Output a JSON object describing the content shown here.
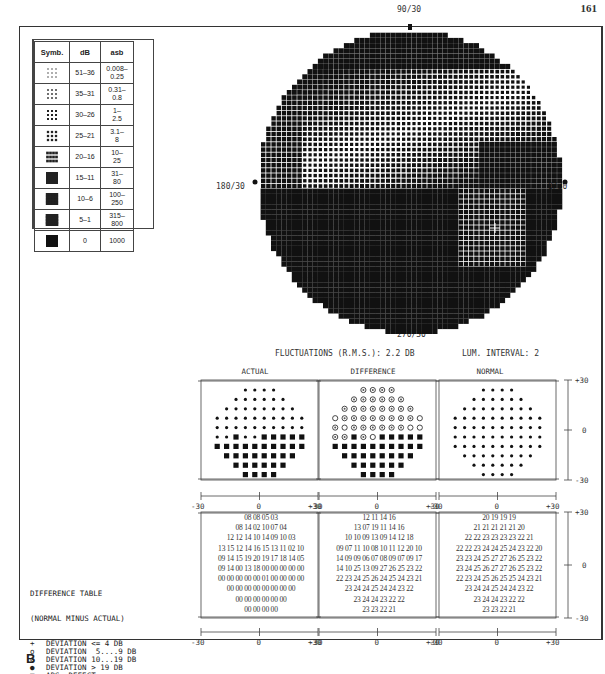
{
  "page_number": "161",
  "figure_label": "B",
  "legend": {
    "headers": [
      "Symb.",
      "dB",
      "asb"
    ],
    "rows": [
      {
        "symbol": "density-1",
        "db": "51–36",
        "asb": "0.008– 0.25"
      },
      {
        "symbol": "density-2",
        "db": "35–31",
        "asb": "0.31– 0.8"
      },
      {
        "symbol": "density-3",
        "db": "30–26",
        "asb": "1– 2.5"
      },
      {
        "symbol": "density-4",
        "db": "25–21",
        "asb": "3.1– 8"
      },
      {
        "symbol": "density-5",
        "db": "20–16",
        "asb": "10– 25"
      },
      {
        "symbol": "density-6",
        "db": "15–11",
        "asb": "31– 80"
      },
      {
        "symbol": "density-7",
        "db": "10–6",
        "asb": "100– 250"
      },
      {
        "symbol": "density-8",
        "db": "5–1",
        "asb": "315– 800"
      },
      {
        "symbol": "solid",
        "db": "0",
        "asb": "1000"
      }
    ]
  },
  "greyscale_map": {
    "label_top": "90/30",
    "label_bottom": "270/30",
    "label_left": "180/30",
    "label_right": "0/30"
  },
  "status": {
    "fluctuations": "FLUCTUATIONS (R.M.S.):  2.2 DB",
    "lum_interval": "LUM. INTERVAL: 2"
  },
  "panels": {
    "titles": [
      "ACTUAL",
      "DIFFERENCE",
      "NORMAL"
    ],
    "x_ticks": [
      "-30",
      "0",
      "+30"
    ],
    "y_ticks": [
      "+30",
      "0",
      "-30"
    ]
  },
  "symbol_grids": {
    "actual": [
      "....",
      "......",
      "........",
      "..........",
      "..........",
      "..S..SSSSS",
      "SSSSSSSSSS",
      "SSSSSSSS",
      "SSSSSS",
      "SSSS"
    ],
    "difference": [
      "GGGG",
      "GGGGGG",
      "GGGGGGGG",
      "OGGGGGGGGO",
      "GOGGGGGGOO",
      "GGSGOSSSSS",
      "SSSSSSSSSS",
      "SSSSSSSS",
      "SSSSSS",
      "SSSS"
    ],
    "normal": [
      "....",
      "......",
      "........",
      "..........",
      "..........",
      "..........",
      "..........",
      "........",
      "......",
      "...."
    ]
  },
  "value_tables": {
    "actual": [
      "08 08 05 03",
      "08 14 02 10 07 04",
      "12 12 14 10 14 09 10 03",
      "13 15 12 14 16 15 13 11 02 10",
      "09 14 15 19 20 19 17 18 14 05",
      "09 14 00 13 18 00 00 00 00 00",
      "00 00 00 00 00 01 00 00 00 00",
      "00 00 00 00 00 00 00 00",
      "00 00 00 00 00 00",
      "00 00 00 00"
    ],
    "difference": [
      "12 11 14 16",
      "13 07 19 11 14 16",
      "10 10 09 13 09 14 12 18",
      "09 07 11 10 08 10 11 12 20 10",
      "14 09 09 06 07 08 09 07 09 17",
      "14 10 25 13 09 27 26 25 23 22",
      "22 23 24 25 26 24 25 24 23 21",
      "23 24 24 25 24 24 23 22",
      "23 24 24 23 22 22",
      "23 23 22 21"
    ],
    "normal": [
      "20 19 19 19",
      "21 21 21 21 21 20",
      "22 22 23 23 23 23 22 21",
      "22 22 23 24 24 25 24 23 22 20",
      "23 23 24 25 27 27 26 25 23 22",
      "23 24 25 26 27 27 26 25 23 22",
      "22 23 24 25 26 25 25 24 23 21",
      "23 24 24 25 24 24 23 22",
      "23 24 24 23 22 22",
      "23 23 22 21"
    ]
  },
  "difference_legend": {
    "title": "DIFFERENCE TABLE",
    "subtitle": "(NORMAL MINUS ACTUAL)",
    "items": [
      {
        "symbol": "+",
        "text": "DEVIATION <= 4 DB"
      },
      {
        "symbol": "o",
        "text": "DEVIATION  5....9 DB"
      },
      {
        "symbol": "⊘",
        "text": "DEVIATION 10...19 DB"
      },
      {
        "symbol": "●",
        "text": "DEVIATION > 19 DB"
      },
      {
        "symbol": "■",
        "text": "ABS. DEFECT"
      }
    ]
  }
}
